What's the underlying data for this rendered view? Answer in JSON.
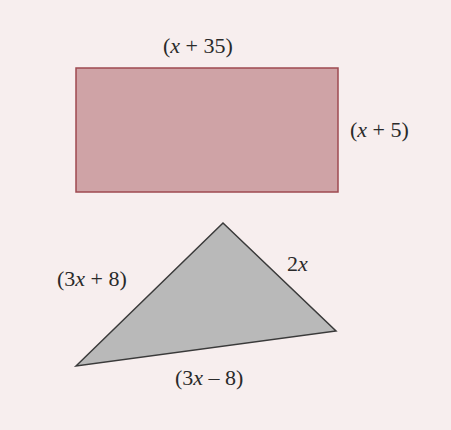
{
  "background_color": "#f7eeee",
  "rectangle": {
    "fill": "#cfa3a6",
    "stroke": "#9e4a50",
    "labels": {
      "top": "(x + 35)",
      "right": "(x + 5)"
    }
  },
  "triangle": {
    "fill": "#b9b9b9",
    "stroke": "#3a3a3a",
    "labels": {
      "left": "(3x + 8)",
      "right": "2x",
      "bottom": "(3x – 8)"
    }
  }
}
